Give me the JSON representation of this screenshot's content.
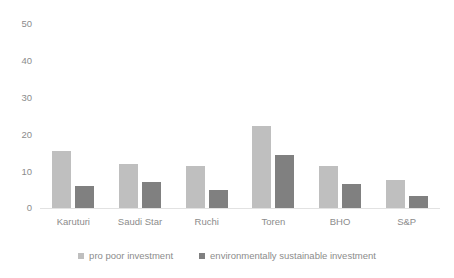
{
  "chart_data": {
    "type": "bar",
    "title": "",
    "subtitle": "",
    "xlabel": "",
    "ylabel": "",
    "ylim": [
      0,
      50
    ],
    "yticks": [
      0,
      10,
      20,
      30,
      40,
      50
    ],
    "ytick_labels": [
      "0",
      "10",
      "20",
      "30",
      "40",
      "50"
    ],
    "grid": false,
    "legend_position": "bottom",
    "categories": [
      "Karuturi",
      "Saudi Star",
      "Ruchi",
      "Toren",
      "BHO",
      "S&P"
    ],
    "series": [
      {
        "name": "pro poor investment",
        "color": "#bfbfbf",
        "values": [
          15.5,
          12,
          11.5,
          22.3,
          11.3,
          7.5
        ]
      },
      {
        "name": "environmentally sustainable investment",
        "color": "#808080",
        "values": [
          6,
          7,
          5,
          14.5,
          6.5,
          3.2
        ]
      }
    ]
  },
  "axis": {
    "y_tick_0": "50",
    "y_tick_1": "40",
    "y_tick_2": "30",
    "y_tick_3": "20",
    "y_tick_4": "10",
    "y_tick_5": "0"
  },
  "x_labels": {
    "l0": "Karuturi",
    "l1": "Saudi Star",
    "l2": "Ruchi",
    "l3": "Toren",
    "l4": "BHO",
    "l5": "S&P"
  },
  "legend": {
    "items": [
      {
        "label": "pro poor investment",
        "swatch": "legend-swatch-pro-poor"
      },
      {
        "label": "environmentally sustainable investment",
        "swatch": "legend-swatch-env-sustainable"
      }
    ]
  },
  "colors": {
    "series_pro_poor": "#bfbfbf",
    "series_env_sustainable": "#808080",
    "axis_text": "#8c8c8c",
    "axis_line": "#e2e2e2",
    "background": "#ffffff"
  }
}
